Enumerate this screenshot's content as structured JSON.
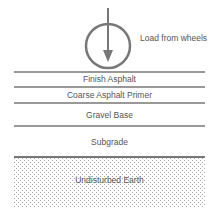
{
  "diagram": {
    "load_label": "Load from wheels",
    "layers": [
      {
        "name": "Finish Asphalt"
      },
      {
        "name": "Coarse Asphalt Primer"
      },
      {
        "name": "Gravel Base"
      },
      {
        "name": "Subgrade"
      },
      {
        "name": "Undisturbed Earth"
      }
    ],
    "colors": {
      "line": "#777777",
      "text": "#555555"
    }
  }
}
